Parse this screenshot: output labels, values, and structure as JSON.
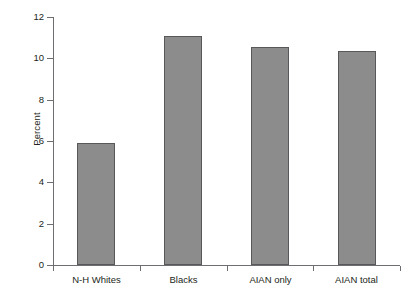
{
  "chart_data": {
    "type": "bar",
    "title": "",
    "subtitle": "",
    "xlabel": "",
    "ylabel": "Percent",
    "categories": [
      "N-H Whites",
      "Blacks",
      "AIAN only",
      "AIAN total"
    ],
    "values": [
      5.9,
      11.1,
      10.55,
      10.35
    ],
    "series": [
      {
        "name": "Percent",
        "values": [
          5.9,
          11.1,
          10.55,
          10.35
        ]
      }
    ],
    "ylim": [
      0,
      12
    ],
    "ytick_values": [
      0,
      2,
      4,
      6,
      8,
      10,
      12
    ],
    "ytick_labels": [
      "0",
      "2",
      "4",
      "6",
      "8",
      "10",
      "12"
    ],
    "grid": false,
    "legend": false,
    "legend_position": "none",
    "annotations": [],
    "colors": {
      "bar_fill": "#8c8c8c",
      "bar_edge": "#58585a",
      "axis": "#6d6e71",
      "text": "#231f20",
      "background": "#ffffff"
    }
  }
}
